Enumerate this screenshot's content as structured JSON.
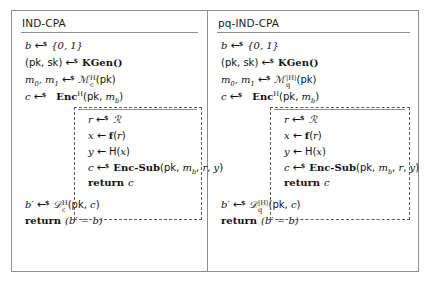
{
  "figure": {
    "kind": "cryptographic-game-pseudocode",
    "panels": [
      {
        "id": "ind-cpa",
        "title": "IND-CPA",
        "lines": [
          {
            "lhs": "b",
            "op": "random",
            "rhs": "{0, 1}"
          },
          {
            "lhs": "(pk, sk)",
            "op": "random",
            "rhs": "KGen()"
          },
          {
            "lhs": "m0, m1",
            "op": "random",
            "rhs": "M_c^H(pk)"
          },
          {
            "lhs": "c",
            "op": "random",
            "rhs": "Enc^H(pk, mb)"
          }
        ],
        "inner_box": {
          "header": "Enc^H(pk, mb)",
          "lines": [
            {
              "lhs": "r",
              "op": "random",
              "rhs": "R"
            },
            {
              "lhs": "x",
              "op": "gets",
              "rhs": "f(r)"
            },
            {
              "lhs": "y",
              "op": "gets",
              "rhs": "H(x)"
            },
            {
              "lhs": "c",
              "op": "random",
              "rhs": "Enc-Sub(pk, mb, r, y)"
            },
            {
              "keyword": "return",
              "value": "c"
            }
          ]
        },
        "tail": [
          {
            "lhs": "b'",
            "op": "random",
            "rhs": "D_c^H(pk, c)"
          },
          {
            "keyword": "return",
            "value": "(b' = b)"
          }
        ]
      },
      {
        "id": "pq-ind-cpa",
        "title": "pq-IND-CPA",
        "lines": [
          {
            "lhs": "b",
            "op": "random",
            "rhs": "{0, 1}"
          },
          {
            "lhs": "(pk, sk)",
            "op": "random",
            "rhs": "KGen()"
          },
          {
            "lhs": "m0, m1",
            "op": "random",
            "rhs": "M_q^{|H>}(pk)"
          },
          {
            "lhs": "c",
            "op": "random",
            "rhs": "Enc^H(pk, mb)"
          }
        ],
        "inner_box": {
          "header": "Enc^H(pk, mb)",
          "lines": [
            {
              "lhs": "r",
              "op": "random",
              "rhs": "R"
            },
            {
              "lhs": "x",
              "op": "gets",
              "rhs": "f(r)"
            },
            {
              "lhs": "y",
              "op": "gets",
              "rhs": "H(x)"
            },
            {
              "lhs": "c",
              "op": "random",
              "rhs": "Enc-Sub(pk, mb, r, y)"
            },
            {
              "keyword": "return",
              "value": "c"
            }
          ]
        },
        "tail": [
          {
            "lhs": "b'",
            "op": "random",
            "rhs": "D_q^{|H>}(pk, c)"
          },
          {
            "keyword": "return",
            "value": "(b' = b)"
          }
        ]
      }
    ],
    "symbols": {
      "random_arrow": "←",
      "random_mark": "$",
      "plain_arrow": "←",
      "set_01": "{0, 1}",
      "kgen": "KGen()",
      "script_m": "ℳ",
      "script_r": "ℛ",
      "script_d": "𝒟",
      "oracle_h": "H",
      "quantum_oracle": "|H⟩",
      "sub_c": "c",
      "sub_q": "q",
      "sub_b": "b",
      "return_kw": "return",
      "enc": "Enc",
      "enc_sub": "Enc-Sub",
      "f_fn": "f",
      "pk": "pk",
      "sk": "sk",
      "m0": "m",
      "m1": "m",
      "b_prime": "b′",
      "equals": "=",
      "paren_open": "(",
      "paren_close": ")",
      "comma": ","
    },
    "colors": {
      "frame": "#8d8d8d",
      "dashed": "#5d5d5d",
      "text": "#111111",
      "background": "#ffffff"
    }
  }
}
